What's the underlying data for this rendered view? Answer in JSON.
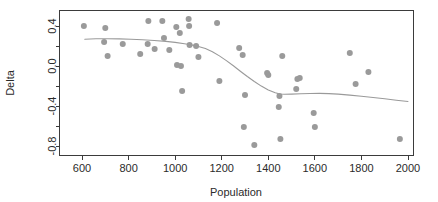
{
  "chart_data": {
    "type": "scatter",
    "title": "",
    "xlabel": "Population",
    "ylabel": "Delta",
    "xlim": [
      530,
      2060
    ],
    "ylim": [
      -0.92,
      0.54
    ],
    "grid": false,
    "legend": null,
    "x_ticks": [
      600,
      800,
      1000,
      1200,
      1400,
      1600,
      1800,
      2000
    ],
    "x_tick_labels": [
      "600",
      "800",
      "1000",
      "1200",
      "1400",
      "1600",
      "1800",
      "2000"
    ],
    "x_minor_ticks": [],
    "y_ticks": [
      0.4,
      0.2,
      0.0,
      -0.2,
      -0.4,
      -0.6,
      -0.8
    ],
    "y_tick_labels": [
      "0.4",
      "",
      "0.0",
      "",
      "-0.4",
      "",
      "-0.8"
    ],
    "y_labeled_ticks": [
      0.4,
      0.0,
      -0.4,
      -0.8
    ],
    "point_color": "#9a9a9a",
    "line_color": "#9a9a9a",
    "axis_color": "#3b3b3b",
    "background": "#ffffff",
    "point_radius": 3.0,
    "series": [
      {
        "name": "observations",
        "type": "scatter",
        "points": [
          [
            608,
            0.4
          ],
          [
            700,
            0.38
          ],
          [
            695,
            0.24
          ],
          [
            710,
            0.1
          ],
          [
            775,
            0.22
          ],
          [
            850,
            0.12
          ],
          [
            885,
            0.45
          ],
          [
            882,
            0.22
          ],
          [
            912,
            0.17
          ],
          [
            945,
            0.45
          ],
          [
            952,
            0.28
          ],
          [
            975,
            0.16
          ],
          [
            1005,
            0.39
          ],
          [
            1008,
            0.01
          ],
          [
            1020,
            0.33
          ],
          [
            1025,
            0.0
          ],
          [
            1030,
            -0.25
          ],
          [
            1058,
            0.47
          ],
          [
            1060,
            0.4
          ],
          [
            1062,
            0.21
          ],
          [
            1090,
            0.2
          ],
          [
            1100,
            0.09
          ],
          [
            1180,
            0.43
          ],
          [
            1190,
            -0.15
          ],
          [
            1275,
            0.18
          ],
          [
            1290,
            0.11
          ],
          [
            1295,
            -0.61
          ],
          [
            1300,
            -0.29
          ],
          [
            1340,
            -0.79
          ],
          [
            1395,
            -0.07
          ],
          [
            1400,
            -0.09
          ],
          [
            1445,
            -0.41
          ],
          [
            1448,
            -0.3
          ],
          [
            1452,
            -0.73
          ],
          [
            1460,
            0.1
          ],
          [
            1520,
            -0.23
          ],
          [
            1525,
            -0.13
          ],
          [
            1535,
            -0.12
          ],
          [
            1595,
            -0.47
          ],
          [
            1600,
            -0.61
          ],
          [
            1750,
            0.13
          ],
          [
            1775,
            -0.18
          ],
          [
            1830,
            -0.06
          ],
          [
            1965,
            -0.73
          ]
        ]
      },
      {
        "name": "loess-smooth",
        "type": "line",
        "points": [
          [
            612,
            0.268
          ],
          [
            660,
            0.272
          ],
          [
            710,
            0.273
          ],
          [
            760,
            0.271
          ],
          [
            810,
            0.267
          ],
          [
            860,
            0.262
          ],
          [
            910,
            0.255
          ],
          [
            960,
            0.246
          ],
          [
            1000,
            0.236
          ],
          [
            1040,
            0.223
          ],
          [
            1060,
            0.215
          ],
          [
            1080,
            0.206
          ],
          [
            1100,
            0.196
          ],
          [
            1130,
            0.174
          ],
          [
            1160,
            0.142
          ],
          [
            1190,
            0.101
          ],
          [
            1220,
            0.054
          ],
          [
            1250,
            0.002
          ],
          [
            1280,
            -0.052
          ],
          [
            1310,
            -0.105
          ],
          [
            1340,
            -0.155
          ],
          [
            1370,
            -0.201
          ],
          [
            1400,
            -0.24
          ],
          [
            1430,
            -0.268
          ],
          [
            1450,
            -0.28
          ],
          [
            1470,
            -0.283
          ],
          [
            1500,
            -0.281
          ],
          [
            1540,
            -0.278
          ],
          [
            1580,
            -0.275
          ],
          [
            1620,
            -0.274
          ],
          [
            1660,
            -0.276
          ],
          [
            1700,
            -0.281
          ],
          [
            1750,
            -0.291
          ],
          [
            1800,
            -0.303
          ],
          [
            1850,
            -0.315
          ],
          [
            1900,
            -0.328
          ],
          [
            1950,
            -0.342
          ],
          [
            2000,
            -0.355
          ]
        ]
      }
    ]
  }
}
